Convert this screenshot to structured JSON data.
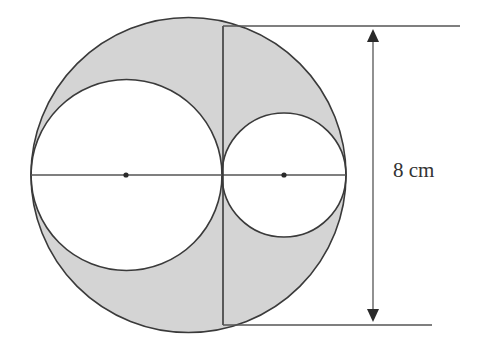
{
  "diagram": {
    "type": "geometry",
    "colors": {
      "shade": "#d4d4d4",
      "stroke": "#3a3a3a",
      "background": "#ffffff"
    },
    "outer_circle": {
      "cx": 188.5,
      "cy": 175,
      "r": 157.5
    },
    "large_inner_circle": {
      "cx": 126.5,
      "cy": 175,
      "r": 95.5
    },
    "small_inner_circle": {
      "cx": 284,
      "cy": 175,
      "r": 62
    },
    "diameter_line": {
      "x1": 31,
      "y1": 175,
      "x2": 346,
      "y2": 175
    },
    "chord": {
      "x1": 223,
      "y1": 26,
      "x2": 223,
      "y2": 325
    },
    "center_points": [
      {
        "x": 126,
        "y": 175
      },
      {
        "x": 284,
        "y": 175
      }
    ],
    "dimension": {
      "label": "8 cm",
      "top_extension": {
        "x1": 223,
        "y1": 26,
        "x2": 460,
        "y2": 26
      },
      "bottom_extension": {
        "x1": 223,
        "y1": 325,
        "x2": 432,
        "y2": 325
      },
      "arrow_x": 373,
      "arrow_top": 28,
      "arrow_bottom": 323,
      "label_x": 393,
      "label_y": 177
    }
  }
}
